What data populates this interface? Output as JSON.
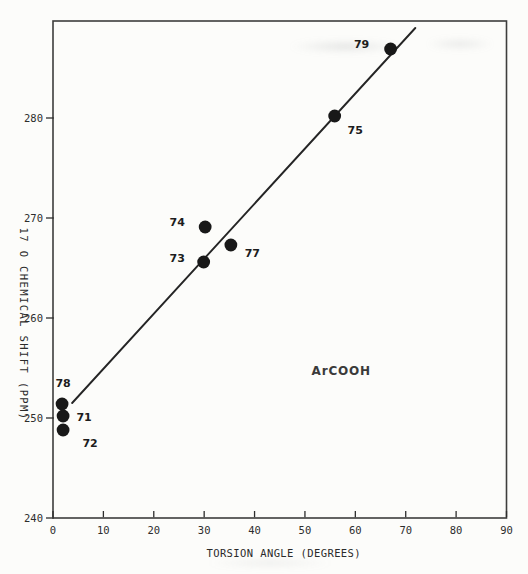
{
  "figure": {
    "background": "#fcfcfa",
    "colors": {
      "frame": "#3d3d3d",
      "tick": "#2d2d2d",
      "dot": "#181818",
      "line": "#252525"
    }
  },
  "chart_data": {
    "type": "scatter",
    "title": "",
    "xlabel": "TORSION ANGLE (DEGREES)",
    "ylabel": "17 O CHEMICAL SHIFT (PPM)",
    "xlim": [
      0,
      90
    ],
    "ylim": [
      240,
      289.7
    ],
    "xticks": [
      0,
      10,
      20,
      30,
      40,
      50,
      60,
      70,
      80,
      90
    ],
    "yticks": [
      240,
      250,
      260,
      270,
      280
    ],
    "grid": false,
    "legend": "none",
    "annotation": "ArCOOH",
    "annotation_xy": [
      57.2,
      254.7
    ],
    "points": [
      {
        "label": "71",
        "x": 2.0,
        "y": 250.2,
        "label_dx": 21,
        "label_dy": 1
      },
      {
        "label": "72",
        "x": 2.0,
        "y": 248.8,
        "label_dx": 27,
        "label_dy": 13
      },
      {
        "label": "73",
        "x": 29.9,
        "y": 265.6,
        "label_dx": -26.5,
        "label_dy": -3.5
      },
      {
        "label": "74",
        "x": 30.2,
        "y": 269.1,
        "label_dx": -28,
        "label_dy": -5
      },
      {
        "label": "75",
        "x": 55.9,
        "y": 280.2,
        "label_dx": 20.5,
        "label_dy": 14
      },
      {
        "label": "77",
        "x": 35.3,
        "y": 267.3,
        "label_dx": 21.5,
        "label_dy": 8
      },
      {
        "label": "78",
        "x": 1.8,
        "y": 251.4,
        "label_dx": 1,
        "label_dy": -21
      },
      {
        "label": "79",
        "x": 67.0,
        "y": 286.9,
        "label_dx": -29,
        "label_dy": -4.5
      }
    ],
    "fit_line": {
      "x1": 3.8,
      "y1": 251.5,
      "x2": 71.9,
      "y2": 289.0
    }
  }
}
